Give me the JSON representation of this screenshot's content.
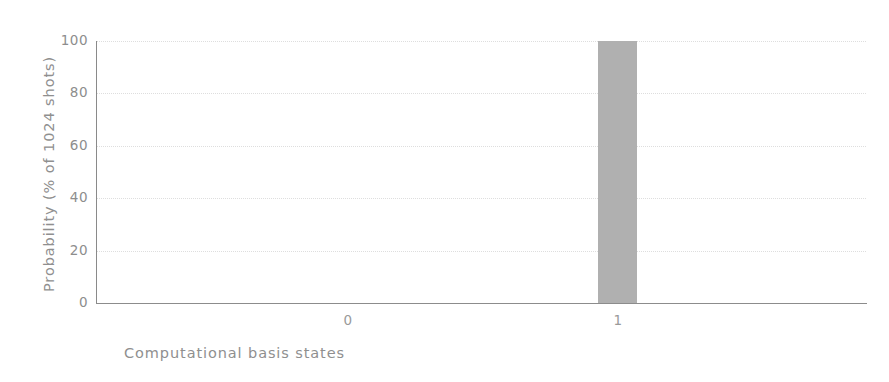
{
  "chart_data": {
    "type": "bar",
    "title": "",
    "subtitle": "",
    "xlabel": "Computational basis states",
    "ylabel": "Probability (% of 1024 shots)",
    "categories": [
      "0",
      "1"
    ],
    "values": [
      0,
      100
    ],
    "series": [
      {
        "name": "Measurement outcome",
        "values": [
          0,
          100
        ]
      }
    ],
    "ylim": [
      0,
      100
    ],
    "yticks": [
      "0",
      "20",
      "40",
      "60",
      "80",
      "100"
    ],
    "ytick_values": [
      0,
      20,
      40,
      60,
      80,
      100
    ],
    "xticks": [
      "0",
      "1"
    ],
    "grid": "horizontal",
    "legend": "none",
    "bar_color": "#b0b0b0",
    "axis_color": "#8c8c8c",
    "grid_color": "#d9d9d9",
    "tick_label_color": "#8d8d8d",
    "axis_title_color": "#8f8f8f",
    "background_color": "#ffffff",
    "annotations": []
  }
}
